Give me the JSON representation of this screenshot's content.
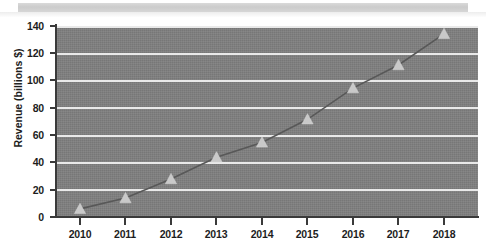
{
  "chart_data": {
    "type": "line",
    "title": "",
    "xlabel": "",
    "ylabel": "Revenue (billions $)",
    "categories": [
      "2010",
      "2011",
      "2012",
      "2013",
      "2014",
      "2015",
      "2016",
      "2017",
      "2018"
    ],
    "x": [
      2010,
      2011,
      2012,
      2013,
      2014,
      2015,
      2016,
      2017,
      2018
    ],
    "values": [
      6,
      14,
      28,
      44,
      55,
      72,
      95,
      112,
      135
    ],
    "series": [
      {
        "name": "Revenue",
        "values": [
          6,
          14,
          28,
          44,
          55,
          72,
          95,
          112,
          135
        ]
      }
    ],
    "ylim": [
      0,
      145
    ],
    "yticks": [
      0,
      20,
      40,
      60,
      80,
      100,
      120,
      140
    ],
    "ytick_labels": [
      "0",
      "20",
      "40",
      "60",
      "80",
      "100",
      "120",
      "140"
    ],
    "xlim": [
      2009.5,
      2018.5
    ],
    "grid": true,
    "grid_axis": "y",
    "legend": false,
    "legend_position": "none",
    "marker": "triangle",
    "plot_background_color": "#7f7f7f",
    "gridline_color": "#e9e9e9",
    "line_color": "#585858",
    "marker_color": "#c9c9c9",
    "axis_color": "#3a3a3a",
    "text_color": "#1d1d1d",
    "figure_background_color": "#ffffff"
  }
}
